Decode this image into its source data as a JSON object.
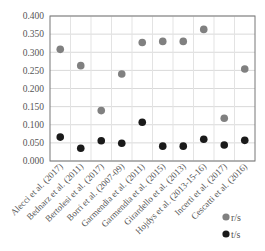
{
  "chart_data": {
    "type": "scatter",
    "title": "",
    "xlabel": "",
    "ylabel": "",
    "ylim": [
      0,
      0.4
    ],
    "yticks": [
      "0.000",
      "0.050",
      "0.100",
      "0.150",
      "0.200",
      "0.250",
      "0.300",
      "0.350",
      "0.400"
    ],
    "grid": true,
    "legend_position": "bottom-right",
    "categories": [
      "Alecci et al. (2017)",
      "Bednarz et al. (2011)",
      "Bertolesi et al. (2017)",
      "Borri et al. (2007-09)",
      "Garmendia et al. (2011)",
      "Garmendia et al. (2015)",
      "Girardello et al. (2013)",
      "Hojdys et al. (2013-15-16)",
      "Incerti et al. (2017)",
      "Cescatti  et al. (2016)"
    ],
    "series": [
      {
        "name": "r/s",
        "color": "#808080",
        "values": [
          0.308,
          0.263,
          0.139,
          0.24,
          0.327,
          0.33,
          0.33,
          0.363,
          0.118,
          0.254
        ]
      },
      {
        "name": "t/s",
        "color": "#1a1a1a",
        "values": [
          0.066,
          0.035,
          0.056,
          0.049,
          0.107,
          0.041,
          0.041,
          0.06,
          0.044,
          0.057
        ]
      }
    ]
  }
}
